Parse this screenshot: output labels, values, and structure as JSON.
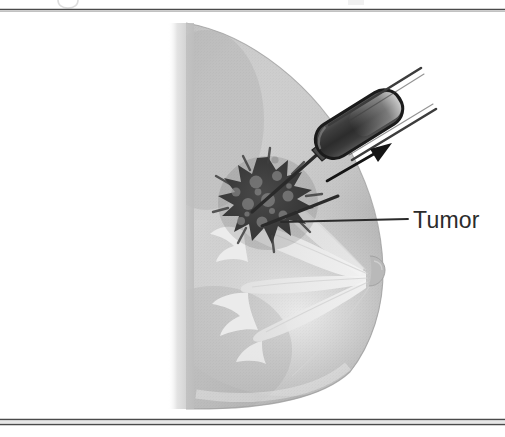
{
  "figure": {
    "background_color": "#ffffff"
  },
  "borders": {
    "top_rule": {
      "name": "top-rule",
      "color": "#4a4a4a",
      "y": 9
    },
    "bottom_rule_outer": {
      "name": "bottom-rule-outer",
      "color": "#4a4a4a",
      "y": 419
    },
    "bottom_rule_inner": {
      "name": "bottom-rule-inner",
      "color": "#4a4a4a",
      "y": 424
    }
  },
  "labels": {
    "tumor": {
      "text": "Tumor",
      "color": "#2b2b2b",
      "x": 413,
      "y": 227,
      "font_size": 23
    }
  },
  "leader_line": {
    "name": "tumor-leader-line",
    "color": "#2b2b2b",
    "from_x": 281,
    "from_y": 222,
    "to_x": 408,
    "to_y": 219
  },
  "anatomy": {
    "breast": {
      "name": "breast-profile",
      "fill_light": "#f2f2f2",
      "fill_mid": "#c9c9c9",
      "fill_dark": "#a8a8a8",
      "outline_color": "#9a9a9a"
    },
    "chest_wall": {
      "name": "chest-wall",
      "x": 186,
      "color": "#c4c4c4"
    },
    "nipple": {
      "name": "nipple",
      "x": 372,
      "y": 273,
      "color": "#b6b6b6"
    },
    "ducts": {
      "name": "milk-ducts",
      "color": "#ececec",
      "count": 7
    },
    "tumor_mass": {
      "name": "tumor-mass",
      "center_x": 268,
      "center_y": 203,
      "radius": 46,
      "color_dark": "#3d3d3d",
      "color_mottle": "#8e8e8e"
    }
  },
  "instrument": {
    "needle_device": {
      "name": "biopsy-needle-device",
      "body_color": "#3a3a3a",
      "outline_color": "#1e1e1e",
      "shaft_color": "#2a2a2a",
      "angle_degrees": -32
    },
    "guide_lines": {
      "name": "needle-guide-lines",
      "color": "#4a4a4a",
      "count": 2
    },
    "direction_arrow": {
      "name": "direction-arrow",
      "color": "#141414",
      "from_x": 327,
      "from_y": 181,
      "to_x": 392,
      "to_y": 143
    }
  },
  "scan_artifacts": {
    "top_glyph_fragment": {
      "name": "scan-glyph-fragment",
      "x": 62,
      "y": 0
    },
    "top_right_fragment": {
      "name": "scan-fragment-right",
      "x": 352,
      "y": 0
    }
  }
}
